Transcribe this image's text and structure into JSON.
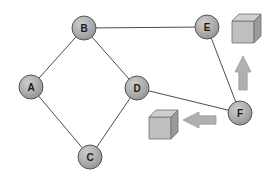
{
  "diagram": {
    "canvas": {
      "width": 272,
      "height": 180,
      "background": "#ffffff"
    },
    "style": {
      "node_fill": "#a9a9a9",
      "node_fill_light": "#c8c8c8",
      "node_stroke": "#555555",
      "node_radius": 12,
      "label_color": "#1a1a1a",
      "edge_color": "#4d4d4d",
      "edge_width": 1,
      "cube_top": "#cfcfcf",
      "cube_front": "#bfbfbf",
      "cube_side": "#9a9a9a",
      "cube_stroke": "#6e6e6e",
      "arrow_fill": "#b0b0b0",
      "arrow_stroke": "#9a9a9a"
    },
    "nodes": [
      {
        "id": "A",
        "label": "A",
        "x": 31,
        "y": 87
      },
      {
        "id": "B",
        "label": "B",
        "x": 84,
        "y": 28
      },
      {
        "id": "C",
        "label": "C",
        "x": 90,
        "y": 157
      },
      {
        "id": "D",
        "label": "D",
        "x": 137,
        "y": 88
      },
      {
        "id": "E",
        "label": "E",
        "x": 207,
        "y": 27
      },
      {
        "id": "F",
        "label": "F",
        "x": 240,
        "y": 113
      }
    ],
    "edges": [
      {
        "from": "A",
        "to": "B"
      },
      {
        "from": "B",
        "to": "D"
      },
      {
        "from": "A",
        "to": "C"
      },
      {
        "from": "C",
        "to": "D"
      },
      {
        "from": "B",
        "to": "E"
      },
      {
        "from": "E",
        "to": "F"
      },
      {
        "from": "D",
        "to": "F"
      }
    ],
    "cubes": [
      {
        "id": "cube-top-right",
        "x": 232,
        "y": 14,
        "size": 22,
        "depth": 7
      },
      {
        "id": "cube-center",
        "x": 149,
        "y": 110,
        "size": 22,
        "depth": 7
      }
    ],
    "arrows": [
      {
        "id": "arrow-up",
        "direction": "up",
        "x": 235,
        "y": 56,
        "length": 34,
        "width": 16
      },
      {
        "id": "arrow-left",
        "direction": "left",
        "x": 183,
        "y": 112,
        "length": 33,
        "width": 16
      }
    ]
  }
}
